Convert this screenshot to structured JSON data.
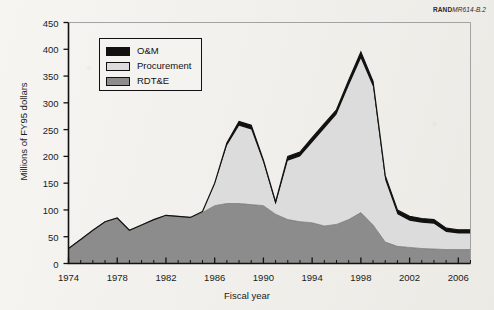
{
  "credit": {
    "brand": "RAND",
    "code": "MR614-B.2"
  },
  "axes": {
    "ylabel": "Millions of FY95 dollars",
    "xlabel": "Fiscal year",
    "yticks": [
      0,
      50,
      100,
      150,
      200,
      250,
      300,
      350,
      400,
      450
    ],
    "xticks": [
      1974,
      1978,
      1982,
      1986,
      1990,
      1994,
      1998,
      2002,
      2006
    ]
  },
  "legend": {
    "items": [
      {
        "label": "O&M",
        "color": "#111111"
      },
      {
        "label": "Procurement",
        "color": "#dcdcdc"
      },
      {
        "label": "RDT&E",
        "color": "#8c8c8c"
      }
    ]
  },
  "colors": {
    "rdte": "#8c8c8c",
    "procurement": "#dcdcdc",
    "om": "#111111",
    "axis": "#111111",
    "background": "#f3f2ee"
  },
  "chart_data": {
    "type": "area",
    "title": "",
    "subtitle": "",
    "xlabel": "Fiscal year",
    "ylabel": "Millions of FY95 dollars",
    "stacked": true,
    "grid": false,
    "legend_position": "inside-top-left",
    "xlim": [
      1974,
      2007
    ],
    "ylim": [
      0,
      450
    ],
    "x": [
      1974,
      1975,
      1976,
      1977,
      1978,
      1979,
      1980,
      1981,
      1982,
      1983,
      1984,
      1985,
      1986,
      1987,
      1988,
      1989,
      1990,
      1991,
      1992,
      1993,
      1994,
      1995,
      1996,
      1997,
      1998,
      1999,
      2000,
      2001,
      2002,
      2003,
      2004,
      2005,
      2006,
      2007
    ],
    "series": [
      {
        "name": "RDT&E",
        "color": "#8c8c8c",
        "values": [
          28,
          45,
          62,
          78,
          85,
          62,
          72,
          82,
          90,
          88,
          86,
          95,
          108,
          112,
          112,
          110,
          108,
          92,
          82,
          78,
          76,
          70,
          73,
          82,
          95,
          72,
          40,
          32,
          30,
          28,
          27,
          26,
          26,
          26
        ]
      },
      {
        "name": "Procurement",
        "color": "#dcdcdc",
        "values": [
          0,
          0,
          0,
          0,
          0,
          0,
          0,
          0,
          0,
          0,
          0,
          2,
          40,
          108,
          145,
          140,
          80,
          18,
          110,
          122,
          150,
          182,
          205,
          250,
          288,
          258,
          116,
          60,
          50,
          48,
          47,
          33,
          30,
          30
        ]
      },
      {
        "name": "O&M",
        "color": "#111111",
        "values": [
          0,
          0,
          0,
          0,
          0,
          0,
          0,
          0,
          0,
          0,
          0,
          0,
          2,
          5,
          8,
          8,
          5,
          5,
          8,
          8,
          9,
          9,
          9,
          10,
          12,
          10,
          8,
          8,
          8,
          8,
          8,
          7,
          7,
          7
        ]
      }
    ],
    "totals": [
      28,
      45,
      62,
      78,
      85,
      62,
      72,
      82,
      90,
      88,
      86,
      97,
      150,
      225,
      265,
      258,
      193,
      115,
      200,
      208,
      235,
      261,
      287,
      342,
      395,
      340,
      164,
      100,
      88,
      84,
      82,
      66,
      63,
      63
    ],
    "annotations": [
      {
        "text": "Local peak near 265 at FY1988"
      },
      {
        "text": "Trough near 115 at FY1991"
      },
      {
        "text": "Peak near 395 at FY1998"
      }
    ]
  }
}
